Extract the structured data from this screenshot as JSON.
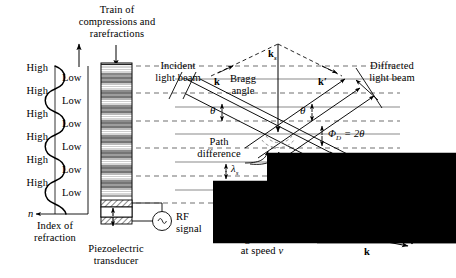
{
  "figure": {
    "title_top": {
      "line1": "Train of",
      "line2": "compressions and",
      "line3": "rarefractions"
    },
    "background_color": "#ffffff",
    "ink_color": "#000000",
    "plane_color": "#808080"
  },
  "left_panel": {
    "high_labels": [
      "High",
      "High",
      "High",
      "High",
      "High",
      "High"
    ],
    "low_labels": [
      "Low",
      "Low",
      "Low",
      "Low",
      "Low",
      "Low"
    ],
    "axis_symbol": "n",
    "axis_caption_line1": "Index of",
    "axis_caption_line2": "refraction"
  },
  "transducer": {
    "caption_line1": "Piezoelectric",
    "caption_line2": "transducer",
    "source_symbol": "~",
    "source_label_line1": "RF",
    "source_label_line2": "signal"
  },
  "optics": {
    "incident_line1": "Incident",
    "incident_line2": "light beam",
    "diffracted_line1": "Diffracted",
    "diffracted_line2": "light beam",
    "undeflected_line1": "Undeflected",
    "undeflected_line2": "light beam",
    "bragg_line1": "Bragg",
    "bragg_line2": "angle",
    "path_line1": "Path",
    "path_line2": "difference",
    "theta_left": "θ",
    "theta_right": "θ",
    "phi_label": "Φ",
    "phi_sub": "D",
    "phi_eq": " = 2θ",
    "lambda_upper": "λ",
    "lambda_upper_sub": "s",
    "lambda_lower": "λ",
    "lambda_lower_sub": "s",
    "k_incident": "k",
    "k_diffracted": "k′",
    "k_sound": "k",
    "k_sound_sub": "s"
  },
  "sound": {
    "line1": "Moving sound waves",
    "line2_pre": "at speed ",
    "line2_var": "v"
  },
  "vector_diagram": {
    "k_prime": "k′",
    "k_sound": "k",
    "k_sound_sub": "s",
    "k_incident": "k"
  }
}
